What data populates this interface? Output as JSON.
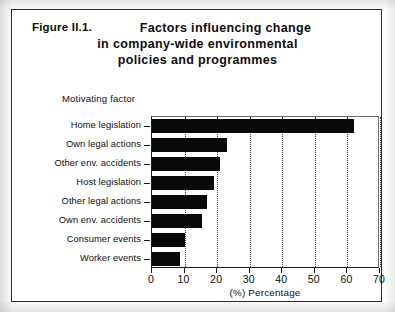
{
  "figure": {
    "label": "Figure II.1.",
    "title_lines": [
      "Factors influencing change",
      "in company-wide environmental",
      "policies and programmes"
    ],
    "group_caption": "Motivating factor"
  },
  "colors": {
    "bar": "#090909",
    "frame": "#2b2b2b",
    "axis": "#1a1a1a",
    "grid": "#3a3a3a",
    "page": "#ffffff"
  },
  "chart_data": {
    "type": "bar",
    "orientation": "horizontal",
    "title": "Factors influencing change in company-wide environmental policies and programmes",
    "xlabel": "(%) Percentage",
    "ylabel": "Motivating factor",
    "xlim": [
      0,
      70
    ],
    "xticks": [
      0,
      10,
      20,
      30,
      40,
      50,
      60,
      70
    ],
    "xtick_labels": [
      "0",
      "10",
      "20",
      "30",
      "40",
      "50",
      "60",
      "70"
    ],
    "grid": "vertical-dotted",
    "legend": null,
    "categories": [
      "Home legislation",
      "Own legal actions",
      "Other env. accidents",
      "Host legislation",
      "Other legal actions",
      "Own env. accidents",
      "Consumer events",
      "Worker events"
    ],
    "values": [
      62,
      23,
      21,
      19,
      17,
      15.5,
      10,
      8.5
    ]
  }
}
